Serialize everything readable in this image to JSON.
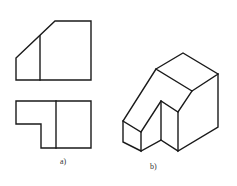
{
  "figure": {
    "subfigures": [
      {
        "id": "a",
        "label": "a)",
        "description": "Two orthographic views: front view (top) and top view (bottom)"
      },
      {
        "id": "b",
        "label": "b)",
        "description": "Isometric view of the solid"
      }
    ],
    "colors": {
      "line": "#1a1a1a",
      "background": "#ffffff"
    }
  }
}
